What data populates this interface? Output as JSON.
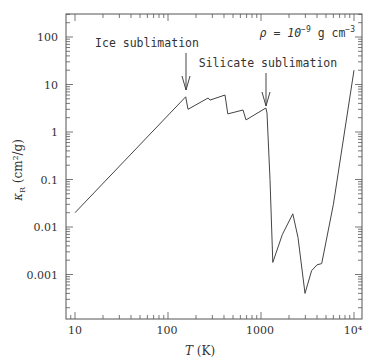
{
  "chart_data": {
    "type": "line",
    "title": "",
    "xlabel": "T (K)",
    "ylabel": "κ_R (cm²/g)",
    "xscale": "log",
    "yscale": "log",
    "xlim": [
      8.5,
      12000
    ],
    "ylim": [
      0.00012,
      300
    ],
    "x_ticks": [
      "10",
      "100",
      "1000",
      "10⁴"
    ],
    "y_ticks": [
      "100",
      "10",
      "1",
      "0.1",
      "0.01",
      "0.001"
    ],
    "grid": false,
    "series": [
      {
        "name": "Rosseland mean opacity",
        "x": [
          10,
          155,
          164,
          270,
          283,
          410,
          440,
          640,
          690,
          1130,
          1160,
          1250,
          1340,
          1700,
          2200,
          2500,
          2970,
          3500,
          4000,
          4500,
          6000,
          10000
        ],
        "y": [
          0.02,
          5.5,
          3.0,
          5.2,
          4.7,
          6.0,
          2.4,
          2.9,
          1.8,
          3.2,
          2.5,
          0.1,
          0.0018,
          0.007,
          0.019,
          0.006,
          0.0004,
          0.0012,
          0.0016,
          0.0017,
          0.03,
          20
        ]
      }
    ],
    "annotations": [
      {
        "text": "Ice sublimation",
        "arrow_x": 155
      },
      {
        "text": "Silicate sublimation",
        "arrow_x": 1130
      },
      {
        "text": "ρ = 10⁻⁹ g cm⁻³"
      }
    ]
  },
  "labels": {
    "ice": "Ice sublimation",
    "silicate": "Silicate sublimation",
    "density_rho": "ρ = 10",
    "density_exp": "−9",
    "density_unit": " g cm",
    "density_unit_exp": "−3",
    "xlabel_T": "T",
    "xlabel_unit": " (K)",
    "ylabel_kappa": "κ",
    "ylabel_sub": "R",
    "ylabel_unit": " (cm²/g)",
    "x10": "10",
    "x100": "100",
    "x1000": "1000",
    "x10k": "10⁴",
    "y100": "100",
    "y10": "10",
    "y1": "1",
    "y01": "0.1",
    "y001": "0.01",
    "y0001": "0.001"
  }
}
